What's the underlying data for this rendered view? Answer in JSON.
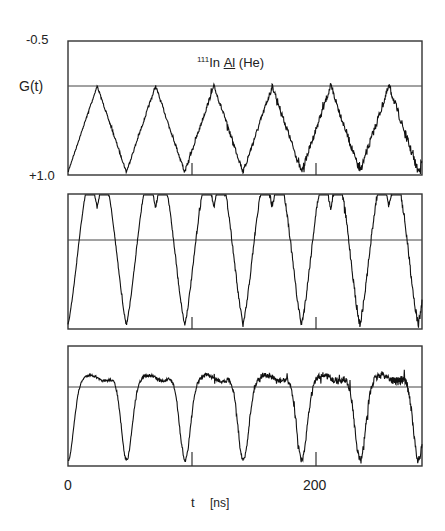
{
  "chart_data": [
    {
      "type": "line",
      "panel": "top",
      "title": "111In Al (He)",
      "title_parts": {
        "isotope_mass": "111",
        "probe": "In",
        "host": "Al",
        "ambient": "(He)"
      },
      "ylabel": "G(t)",
      "yticks": [
        "-0.5",
        "+1.0"
      ],
      "ylim": [
        1.0,
        -0.5
      ],
      "reference_line_value": 0.5,
      "xlim": [
        0,
        285
      ],
      "x_ticks_minor": [
        100,
        200
      ],
      "shape": "triangular",
      "period_ns": 47,
      "peaks_ns": [
        24,
        71,
        119,
        165,
        212,
        258
      ],
      "minima_ns": [
        47,
        94,
        141,
        187,
        234,
        281
      ],
      "peak_level": 0.5,
      "min_level": 1.0,
      "noise_increasing_with_t": true
    },
    {
      "type": "line",
      "panel": "middle",
      "title": "",
      "xlim": [
        0,
        285
      ],
      "x_ticks_minor": [
        100,
        200
      ],
      "shape": "double-peak with deep minima",
      "period_ns": 47,
      "deep_minima_ns": [
        47,
        94,
        141,
        187,
        234,
        281
      ],
      "shallow_minima_ns": [
        24,
        71,
        119,
        165,
        212,
        258
      ],
      "noise_increasing_with_t": true
    },
    {
      "type": "line",
      "panel": "bottom",
      "title": "",
      "xlabel": "t   [ns]",
      "xticks": [
        "0",
        "200"
      ],
      "xtick_values": [
        0,
        200
      ],
      "xlim": [
        0,
        285
      ],
      "x_ticks_minor": [
        100,
        200
      ],
      "shape": "flat plateau with deep minima",
      "period_ns": 47,
      "deep_minima_ns": [
        47,
        94,
        141,
        187,
        234,
        281
      ],
      "noise_increasing_with_t": true
    }
  ],
  "labels": {
    "ytick_top": "-0.5",
    "ylabel": "G(t)",
    "ytick_bottom": "+1.0",
    "title_mass": "111",
    "title_probe": "In",
    "title_host": "Al",
    "title_ambient": "(He)",
    "xtick_0": "0",
    "xtick_200": "200",
    "xlabel_t": "t",
    "xlabel_unit": "[ns]"
  },
  "colors": {
    "trace": "#111111",
    "frame": "#333333",
    "background": "#ffffff"
  }
}
